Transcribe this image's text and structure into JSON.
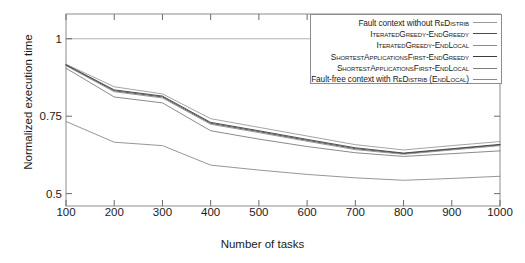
{
  "chart_data": {
    "type": "line",
    "title": "",
    "xlabel": "Number of tasks",
    "ylabel": "Normalized execution time",
    "xlim": [
      100,
      1000
    ],
    "ylim": [
      0.46,
      1.08
    ],
    "xticks": [
      100,
      200,
      300,
      400,
      500,
      600,
      700,
      800,
      900,
      1000
    ],
    "yticks": [
      0.5,
      0.75,
      1
    ],
    "ytick_labels": [
      "0.5",
      "0.75",
      "1"
    ],
    "grid": false,
    "reference_line_y": 1,
    "legend_position": "top-right",
    "x": [
      100,
      200,
      300,
      400,
      500,
      600,
      700,
      800,
      900,
      1000
    ],
    "series": [
      {
        "name": "Fault context without ReDistrib",
        "color": "#9a9a9a",
        "values": [
          0.918,
          0.845,
          0.822,
          0.742,
          0.714,
          0.686,
          0.658,
          0.641,
          0.655,
          0.668
        ]
      },
      {
        "name": "IteratedGreedy-EndGreedy",
        "color": "#4a4a4a",
        "values": [
          0.915,
          0.832,
          0.812,
          0.727,
          0.7,
          0.672,
          0.645,
          0.629,
          0.643,
          0.657
        ]
      },
      {
        "name": "IteratedGreedy-EndLocal",
        "color": "#8c8c8c",
        "values": [
          0.913,
          0.829,
          0.809,
          0.724,
          0.697,
          0.669,
          0.642,
          0.627,
          0.641,
          0.655
        ]
      },
      {
        "name": "ShortestApplicationsFirst-EndGreedy",
        "color": "#3c3c3c",
        "values": [
          0.916,
          0.835,
          0.815,
          0.73,
          0.703,
          0.675,
          0.648,
          0.631,
          0.645,
          0.659
        ]
      },
      {
        "name": "ShortestApplicationsFirst-EndLocal",
        "color": "#7d7d7d",
        "values": [
          0.905,
          0.812,
          0.793,
          0.703,
          0.676,
          0.652,
          0.632,
          0.62,
          0.629,
          0.638
        ]
      },
      {
        "name": "Fault-free context with ReDistrib (EndLocal)",
        "color": "#8a8a8a",
        "values": [
          0.733,
          0.666,
          0.655,
          0.592,
          0.576,
          0.562,
          0.551,
          0.543,
          0.549,
          0.556
        ]
      }
    ],
    "legend_entries": [
      {
        "parts": [
          {
            "t": "Fault context without ",
            "sc": false
          },
          {
            "t": "ReDistrib",
            "sc": true
          }
        ]
      },
      {
        "parts": [
          {
            "t": "IteratedGreedy-EndGreedy",
            "sc": true
          }
        ]
      },
      {
        "parts": [
          {
            "t": "IteratedGreedy-EndLocal",
            "sc": true
          }
        ]
      },
      {
        "parts": [
          {
            "t": "ShortestApplicationsFirst-EndGreedy",
            "sc": true
          }
        ]
      },
      {
        "parts": [
          {
            "t": "ShortestApplicationsFirst-EndLocal",
            "sc": true
          }
        ]
      },
      {
        "parts": [
          {
            "t": "Fault-free context with ",
            "sc": false
          },
          {
            "t": "ReDistrib",
            "sc": true
          },
          {
            "t": " (",
            "sc": false
          },
          {
            "t": "EndLocal",
            "sc": true
          },
          {
            "t": ")",
            "sc": false
          }
        ]
      }
    ]
  }
}
